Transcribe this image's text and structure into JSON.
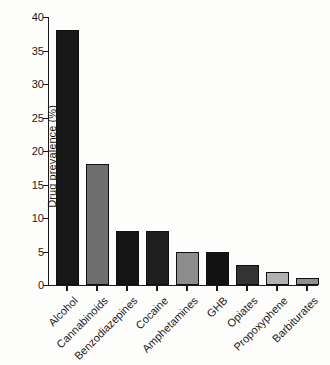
{
  "chart_data": {
    "type": "bar",
    "title": "",
    "xlabel": "",
    "ylabel": "Drug prevalence (%)",
    "ylim": [
      0,
      40
    ],
    "ytick_labels": [
      "0",
      "5",
      "10",
      "15",
      "20",
      "25",
      "30",
      "35",
      "40"
    ],
    "ytick_values": [
      0,
      5,
      10,
      15,
      20,
      25,
      30,
      35,
      40
    ],
    "grid": false,
    "legend": "none",
    "categories": [
      "Alcohol",
      "Cannabinoids",
      "Benzodiazepines",
      "Cocaine",
      "Amphetamines",
      "GHB",
      "Opiates",
      "Propoxyphene",
      "Barbiturates"
    ],
    "values": [
      38,
      18,
      8,
      8,
      5,
      5,
      3,
      2,
      1
    ],
    "bar_colors": [
      "#181818",
      "#6e6e6e",
      "#141414",
      "#1f1f1f",
      "#8d8d8d",
      "#121212",
      "#333333",
      "#b2b2b2",
      "#8f8f8f"
    ],
    "bar_edge_color": "#0f0f0f",
    "axis_color": "#1a1a1a",
    "background_color": "#fdfdfc"
  }
}
